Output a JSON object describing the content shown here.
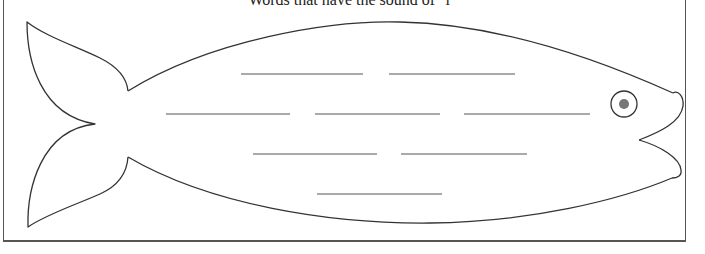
{
  "worksheet": {
    "title_clipped": "Words that have the sound of \"i\"",
    "blank_rows": [
      {
        "blanks": [
          {
            "x1": 241,
            "x2": 363
          },
          {
            "x1": 389,
            "x2": 515
          }
        ],
        "y": 74
      },
      {
        "blanks": [
          {
            "x1": 166,
            "x2": 290
          },
          {
            "x1": 315,
            "x2": 440
          },
          {
            "x1": 464,
            "x2": 590
          }
        ],
        "y": 114
      },
      {
        "blanks": [
          {
            "x1": 253,
            "x2": 377
          },
          {
            "x1": 401,
            "x2": 527
          }
        ],
        "y": 154
      },
      {
        "blanks": [
          {
            "x1": 317,
            "x2": 442
          }
        ],
        "y": 194
      }
    ],
    "blank_count": 8,
    "colors": {
      "outline": "#333333",
      "blank_line": "#555555",
      "pupil": "#777777",
      "frame": "#555555",
      "background": "#ffffff"
    },
    "eye": {
      "cx": 624,
      "cy": 104,
      "r": 13,
      "pupil_r": 5
    }
  }
}
